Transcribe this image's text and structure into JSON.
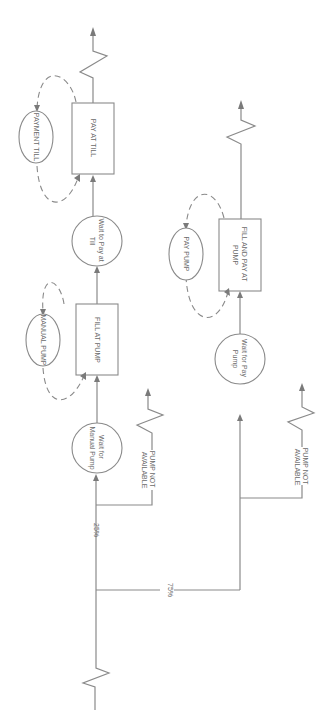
{
  "diagram": {
    "orientation": "rotated-90-clockwise",
    "nodes": {
      "wait_manual_pump": {
        "line1": "Wait for",
        "line2": "Manual Pump"
      },
      "fill_at_pump": {
        "label": "FILL AT PUMP"
      },
      "manual_pump_resource": {
        "label": "MANUAL PUMP"
      },
      "wait_pay_till": {
        "line1": "Wait to Pay at",
        "line2": "Till"
      },
      "pay_at_till": {
        "label": "PAY AT TILL"
      },
      "payment_till_resource": {
        "label": "PAYMENT TILL"
      },
      "wait_pay_pump": {
        "line1": "Wait for Pay",
        "line2": "Pump"
      },
      "fill_and_pay": {
        "line1": "FILL AND PAY AT",
        "line2": "PUMP"
      },
      "pay_pump_resource": {
        "label": "PAY PUMP"
      }
    },
    "branches": {
      "upper_pct": "25%",
      "lower_pct": "75%"
    },
    "exits": {
      "pump_na_1": {
        "line1": "PUMP NOT",
        "line2": "AVAILABLE"
      },
      "pump_na_2": {
        "line1": "PUMP NOT",
        "line2": "AVAILABLE"
      }
    },
    "colors": {
      "line": "#8a8a8a",
      "text": "#6a6a6a",
      "background": "#ffffff"
    }
  }
}
